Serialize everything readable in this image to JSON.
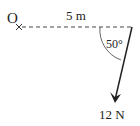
{
  "diagram": {
    "pivot_label": "O",
    "distance_label": "5 m",
    "angle_label": "50°",
    "force_label": "12 N",
    "colors": {
      "line": "#222222",
      "background": "#ffffff"
    }
  }
}
